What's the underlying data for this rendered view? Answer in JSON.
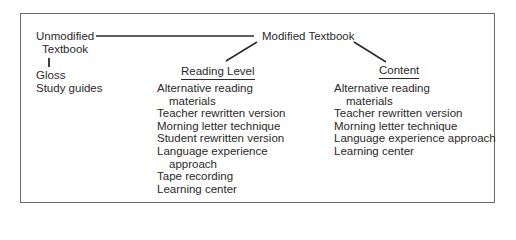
{
  "diagram": {
    "root_left": {
      "line1": "Unmodified",
      "line2": "Textbook",
      "items": [
        "Gloss",
        "Study guides"
      ]
    },
    "root_right": {
      "label": "Modified Textbook"
    },
    "branches": [
      {
        "label": "Reading Level",
        "items": [
          {
            "line1": "Alternative reading",
            "line2": "materials"
          },
          {
            "line1": "Teacher rewritten version",
            "line2": ""
          },
          {
            "line1": "Morning letter technique",
            "line2": ""
          },
          {
            "line1": "Student rewritten version",
            "line2": ""
          },
          {
            "line1": "Language experience",
            "line2": "approach"
          },
          {
            "line1": "Tape recording",
            "line2": ""
          },
          {
            "line1": "Learning center",
            "line2": ""
          }
        ]
      },
      {
        "label": "Content",
        "items": [
          {
            "line1": "Alternative reading",
            "line2": "materials"
          },
          {
            "line1": "Teacher rewritten version",
            "line2": ""
          },
          {
            "line1": "Morning letter technique",
            "line2": ""
          },
          {
            "line1": "Language experience approach",
            "line2": ""
          },
          {
            "line1": "Learning center",
            "line2": ""
          }
        ]
      }
    ]
  }
}
